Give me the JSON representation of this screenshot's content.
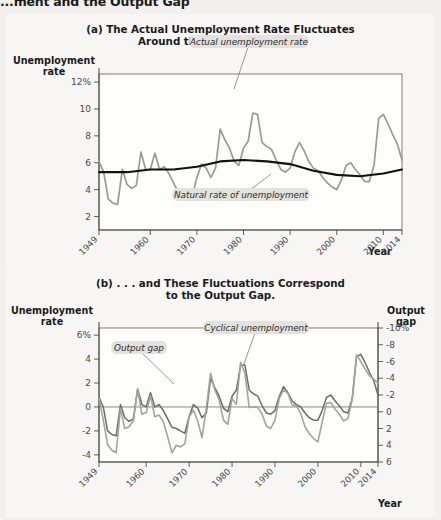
{
  "header": {
    "title": "...ment and the Output Gap"
  },
  "panel_a": {
    "title_line1": "(a) The Actual Unemployment Rate Fluctuates",
    "title_line2": "Around the Natural Rate . . .",
    "ylabel_line1": "Unemployment",
    "ylabel_line2": "rate",
    "xlabel": "Year",
    "callouts": [
      {
        "name": "actual-rate-callout",
        "text": "Actual unemployment rate"
      },
      {
        "name": "natural-rate-callout",
        "text": "Natural rate of unemployment"
      }
    ]
  },
  "panel_b": {
    "title_line1": "(b) . . . and These Fluctuations Correspond",
    "title_line2": "to the Output Gap.",
    "ylabel_left_line1": "Unemployment",
    "ylabel_left_line2": "rate",
    "ylabel_right_line1": "Output",
    "ylabel_right_line2": "gap",
    "xlabel": "Year",
    "callouts": [
      {
        "name": "output-gap-callout",
        "text": "Output gap"
      },
      {
        "name": "cyclical-unemployment-callout",
        "text": "Cyclical unemployment"
      }
    ]
  },
  "colors": {
    "actual_rate": "#9a9a9a",
    "natural_rate": "#111111",
    "output_gap": "#a3a3a3",
    "cyclical_unemployment": "#6b6b6b",
    "panel_bg": "#f7f6f4",
    "page_bg": "#f1f0ee"
  },
  "chart_data": [
    {
      "type": "line",
      "id": "panel-a",
      "title": "(a) The Actual Unemployment Rate Fluctuates Around the Natural Rate . . .",
      "xlabel": "Year",
      "ylabel": "Unemployment rate",
      "xlim": [
        1949,
        2014
      ],
      "ylim": [
        1,
        12.6
      ],
      "xticks": [
        1949,
        1960,
        1970,
        1980,
        1990,
        2000,
        2010,
        2014
      ],
      "xtick_labels": [
        "1949",
        "1960",
        "1970",
        "1980",
        "1990",
        "2000",
        "2010",
        "2014"
      ],
      "yticks": [
        2,
        4,
        6,
        8,
        10,
        12
      ],
      "ytick_labels": [
        "2",
        "4",
        "6",
        "8",
        "10",
        "12%"
      ],
      "grid": false,
      "legend": "annotations",
      "series": [
        {
          "name": "Actual unemployment rate",
          "color": "#9a9a9a",
          "x": [
            1949,
            1950,
            1951,
            1952,
            1953,
            1954,
            1955,
            1956,
            1957,
            1958,
            1959,
            1960,
            1961,
            1962,
            1963,
            1964,
            1965,
            1966,
            1967,
            1968,
            1969,
            1970,
            1971,
            1972,
            1973,
            1974,
            1975,
            1976,
            1977,
            1978,
            1979,
            1980,
            1981,
            1982,
            1983,
            1984,
            1985,
            1986,
            1987,
            1988,
            1989,
            1990,
            1991,
            1992,
            1993,
            1994,
            1995,
            1996,
            1997,
            1998,
            1999,
            2000,
            2001,
            2002,
            2003,
            2004,
            2005,
            2006,
            2007,
            2008,
            2009,
            2010,
            2011,
            2012,
            2013,
            2014
          ],
          "values": [
            6.1,
            5.3,
            3.3,
            3.0,
            2.9,
            5.5,
            4.4,
            4.1,
            4.3,
            6.8,
            5.5,
            5.5,
            6.7,
            5.5,
            5.7,
            5.2,
            4.5,
            3.8,
            3.8,
            3.6,
            3.5,
            4.9,
            5.9,
            5.6,
            4.9,
            5.6,
            8.5,
            7.7,
            7.1,
            6.1,
            5.8,
            7.1,
            7.6,
            9.7,
            9.6,
            7.5,
            7.2,
            7.0,
            6.2,
            5.5,
            5.3,
            5.6,
            6.8,
            7.5,
            6.9,
            6.1,
            5.6,
            5.4,
            4.9,
            4.5,
            4.2,
            4.0,
            4.7,
            5.8,
            6.0,
            5.5,
            5.1,
            4.6,
            4.6,
            5.8,
            9.3,
            9.6,
            8.9,
            8.1,
            7.4,
            6.2
          ]
        },
        {
          "name": "Natural rate of unemployment",
          "color": "#111111",
          "x": [
            1949,
            1955,
            1960,
            1965,
            1970,
            1975,
            1980,
            1985,
            1990,
            1995,
            2000,
            2005,
            2010,
            2014
          ],
          "values": [
            5.3,
            5.3,
            5.5,
            5.5,
            5.7,
            6.1,
            6.2,
            6.1,
            5.9,
            5.4,
            5.1,
            5.0,
            5.2,
            5.5
          ]
        }
      ]
    },
    {
      "type": "line",
      "id": "panel-b",
      "title": "(b) . . . and These Fluctuations Correspond to the Output Gap.",
      "xlabel": "Year",
      "ylabel_left": "Unemployment rate",
      "ylabel_right": "Output gap",
      "xlim": [
        1949,
        2014
      ],
      "ylim_left": [
        -4.6,
        6.6
      ],
      "ylim_right_inverted": [
        6,
        -10
      ],
      "xticks": [
        1949,
        1960,
        1970,
        1980,
        1990,
        2000,
        2010,
        2014
      ],
      "xtick_labels": [
        "1949",
        "1960",
        "1970",
        "1980",
        "1990",
        "2000",
        "2010",
        "2014"
      ],
      "yticks_left": [
        -4,
        -2,
        0,
        2,
        4,
        6
      ],
      "ytick_labels_left": [
        "-4",
        "-2",
        "0",
        "2",
        "4",
        "6%"
      ],
      "yticks_right": [
        -10,
        -8,
        -6,
        -4,
        -2,
        0,
        2,
        4,
        6
      ],
      "ytick_labels_right": [
        "-10%",
        "-8",
        "-6",
        "-4",
        "-2",
        "0",
        "2",
        "4",
        "6"
      ],
      "grid": false,
      "zero_line": true,
      "series": [
        {
          "name": "Cyclical unemployment",
          "color": "#6b6b6b",
          "axis": "left",
          "x": [
            1949,
            1950,
            1951,
            1952,
            1953,
            1954,
            1955,
            1956,
            1957,
            1958,
            1959,
            1960,
            1961,
            1962,
            1963,
            1964,
            1965,
            1966,
            1967,
            1968,
            1969,
            1970,
            1971,
            1972,
            1973,
            1974,
            1975,
            1976,
            1977,
            1978,
            1979,
            1980,
            1981,
            1982,
            1983,
            1984,
            1985,
            1986,
            1987,
            1988,
            1989,
            1990,
            1991,
            1992,
            1993,
            1994,
            1995,
            1996,
            1997,
            1998,
            1999,
            2000,
            2001,
            2002,
            2003,
            2004,
            2005,
            2006,
            2007,
            2008,
            2009,
            2010,
            2011,
            2012,
            2013,
            2014
          ],
          "values": [
            0.8,
            0.0,
            -2.0,
            -2.3,
            -2.4,
            0.2,
            -0.9,
            -1.2,
            -1.0,
            1.5,
            0.2,
            0.0,
            1.2,
            0.0,
            0.2,
            -0.3,
            -1.0,
            -1.7,
            -1.8,
            -2.0,
            -2.2,
            -0.8,
            0.2,
            -0.1,
            -0.9,
            -0.5,
            2.4,
            1.6,
            0.9,
            -0.1,
            -0.4,
            0.9,
            1.4,
            3.5,
            3.5,
            1.4,
            1.1,
            0.9,
            0.1,
            -0.5,
            -0.6,
            -0.3,
            0.9,
            1.7,
            1.2,
            0.5,
            0.2,
            0.0,
            -0.5,
            -0.9,
            -1.1,
            -1.1,
            -0.3,
            0.8,
            1.0,
            0.5,
            0.1,
            -0.4,
            -0.5,
            0.7,
            4.2,
            4.4,
            3.7,
            2.9,
            2.2,
            1.0
          ]
        },
        {
          "name": "Output gap",
          "color": "#a3a3a3",
          "axis": "right",
          "x": [
            1949,
            1950,
            1951,
            1952,
            1953,
            1954,
            1955,
            1956,
            1957,
            1958,
            1959,
            1960,
            1961,
            1962,
            1963,
            1964,
            1965,
            1966,
            1967,
            1968,
            1969,
            1970,
            1971,
            1972,
            1973,
            1974,
            1975,
            1976,
            1977,
            1978,
            1979,
            1980,
            1981,
            1982,
            1983,
            1984,
            1985,
            1986,
            1987,
            1988,
            1989,
            1990,
            1991,
            1992,
            1993,
            1994,
            1995,
            1996,
            1997,
            1998,
            1999,
            2000,
            2001,
            2002,
            2003,
            2004,
            2005,
            2006,
            2007,
            2008,
            2009,
            2010,
            2011,
            2012,
            2013,
            2014
          ],
          "values": [
            -1.6,
            1.0,
            3.9,
            4.6,
            4.9,
            -0.4,
            2.0,
            1.8,
            1.1,
            -2.7,
            0.3,
            0.1,
            -1.9,
            0.6,
            0.4,
            1.2,
            3.0,
            4.9,
            4.0,
            4.2,
            3.8,
            0.6,
            -0.2,
            1.1,
            3.1,
            -0.4,
            -4.6,
            -2.6,
            -1.4,
            1.0,
            1.5,
            -1.6,
            -0.9,
            -5.9,
            -4.6,
            -0.5,
            -0.6,
            -0.5,
            0.3,
            1.7,
            2.0,
            1.0,
            -1.6,
            -2.6,
            -2.2,
            -0.8,
            -0.7,
            0.2,
            1.8,
            2.6,
            3.2,
            3.6,
            1.2,
            -1.0,
            -1.1,
            -0.3,
            0.3,
            1.1,
            0.8,
            -1.5,
            -6.8,
            -6.0,
            -5.1,
            -4.3,
            -3.9,
            -3.4
          ]
        }
      ]
    }
  ]
}
